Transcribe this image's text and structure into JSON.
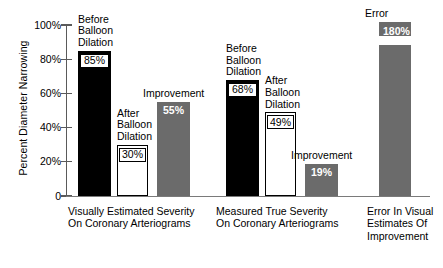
{
  "chart_data": {
    "type": "bar",
    "title": "",
    "subtitle": "",
    "xlabel": "",
    "ylabel": "Percent Diameter Narrowing",
    "ylim": [
      0,
      100
    ],
    "grid": false,
    "legend": "none",
    "y_ticks": [
      "0",
      "20%",
      "40%",
      "60%",
      "80%",
      "100%"
    ],
    "y_tick_values": [
      0,
      20,
      40,
      60,
      80,
      100
    ],
    "groups": [
      {
        "caption_lines": [
          "Visually Estimated Severity",
          "On Coronary Arteriograms"
        ],
        "bars": [
          {
            "label_lines": [
              "Before",
              "Balloon",
              "Dilation"
            ],
            "value": 85,
            "value_text": "85%",
            "style": "black"
          },
          {
            "label_lines": [
              "After",
              "Balloon",
              "Dilation"
            ],
            "value": 30,
            "value_text": "30%",
            "style": "white"
          },
          {
            "label_lines": [
              "Improvement"
            ],
            "value": 55,
            "value_text": "55%",
            "style": "gray"
          }
        ]
      },
      {
        "caption_lines": [
          "Measured True Severity",
          "On Coronary Arteriograms"
        ],
        "bars": [
          {
            "label_lines": [
              "Before",
              "Balloon",
              "Dilation"
            ],
            "value": 68,
            "value_text": "68%",
            "style": "black"
          },
          {
            "label_lines": [
              "After",
              "Balloon",
              "Dilation"
            ],
            "value": 49,
            "value_text": "49%",
            "style": "white"
          },
          {
            "label_lines": [
              "Improvement"
            ],
            "value": 19,
            "value_text": "19%",
            "style": "gray"
          }
        ]
      },
      {
        "caption_lines": [
          "Error In Visual",
          "Estimates Of",
          "Improvement"
        ],
        "bars": [
          {
            "label_lines": [
              "Error"
            ],
            "value": 180,
            "value_text": "180%",
            "style": "gray",
            "axis_break": true
          }
        ]
      }
    ],
    "annotations": [
      "Bar for Error (180%) is drawn with an axis break (zigzag) because it exceeds the 100% scale."
    ],
    "colors": {
      "black_bar": "#000000",
      "white_bar": "#ffffff",
      "gray_bar": "#6b6b6b",
      "axis": "#5a5a5a",
      "text": "#000000"
    }
  },
  "axis": {
    "y_label": "Percent Diameter Narrowing"
  }
}
